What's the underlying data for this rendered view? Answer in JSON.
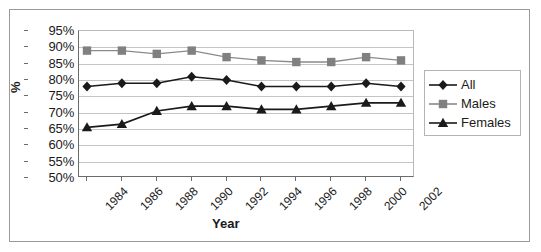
{
  "chart_data": {
    "type": "line",
    "title": "",
    "xlabel": "Year",
    "ylabel": "%",
    "ylim": [
      50,
      95
    ],
    "ytick_labels": [
      "95%",
      "90%",
      "85%",
      "80%",
      "75%",
      "70%",
      "65%",
      "60%",
      "55%",
      "50%"
    ],
    "ytick_values": [
      95,
      90,
      85,
      80,
      75,
      70,
      65,
      60,
      55,
      50
    ],
    "grid": true,
    "legend_position": "right",
    "categories": [
      "1984",
      "1986",
      "1988",
      "1990",
      "1992",
      "1994",
      "1996",
      "1998",
      "2000",
      "2002"
    ],
    "x": [
      1984,
      1986,
      1988,
      1990,
      1992,
      1994,
      1996,
      1998,
      2000,
      2002
    ],
    "series": [
      {
        "name": "All",
        "marker": "diamond",
        "color": "#1a1a1a",
        "values": [
          78.0,
          79.0,
          79.0,
          81.0,
          80.0,
          78.0,
          78.0,
          78.0,
          79.0,
          78.0
        ]
      },
      {
        "name": "Males",
        "marker": "square",
        "color": "#808080",
        "values": [
          89.0,
          89.0,
          88.0,
          89.0,
          87.0,
          86.0,
          85.5,
          85.5,
          87.0,
          86.0
        ]
      },
      {
        "name": "Females",
        "marker": "triangle",
        "color": "#1a1a1a",
        "values": [
          65.5,
          66.5,
          70.5,
          72.0,
          72.0,
          71.0,
          71.0,
          72.0,
          73.0,
          73.0
        ]
      }
    ]
  },
  "legend": {
    "items": [
      {
        "label": "All"
      },
      {
        "label": "Males"
      },
      {
        "label": "Females"
      }
    ]
  },
  "axes": {
    "x_title": "Year",
    "y_title": "%"
  }
}
